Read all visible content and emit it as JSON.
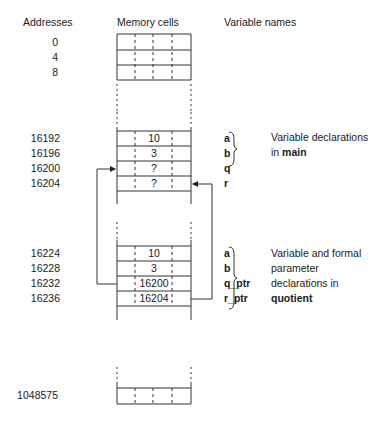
{
  "headers": {
    "addresses": "Addresses",
    "memory_cells": "Memory cells",
    "variable_names": "Variable names"
  },
  "top_block": {
    "addresses": [
      "0",
      "4",
      "8"
    ]
  },
  "main_block": {
    "addresses": [
      "16192",
      "16196",
      "16200",
      "16204"
    ],
    "values": [
      "10",
      "3",
      "?",
      "?"
    ],
    "variables": [
      "a",
      "b",
      "q",
      "r"
    ],
    "annotation_line1": "Variable declarations",
    "annotation_line2_prefix": "in ",
    "annotation_line2_bold": "main"
  },
  "quotient_block": {
    "addresses": [
      "16224",
      "16228",
      "16232",
      "16236"
    ],
    "values": [
      "10",
      "3",
      "16200",
      "16204"
    ],
    "variables": [
      "a",
      "b",
      "q_ptr",
      "r_ptr"
    ],
    "annotation_line1": "Variable and formal",
    "annotation_line2": "parameter",
    "annotation_line3": "declarations in",
    "annotation_line4_bold": "quotient"
  },
  "bottom_block": {
    "address": "1048575"
  },
  "colors": {
    "line": "#333333",
    "text": "#1a1a1a",
    "background": "#ffffff"
  }
}
